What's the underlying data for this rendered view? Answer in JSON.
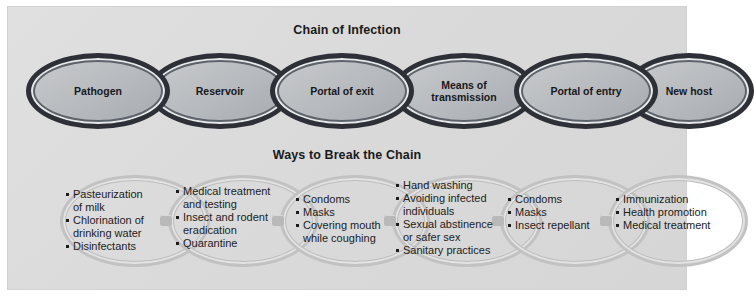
{
  "figure": {
    "background_color": "#dcdcdc",
    "panel_color": "#dadada"
  },
  "chain_section": {
    "title": "Chain of Infection",
    "link_fill_color": "#b6b9bd",
    "link_outline_color": "#2d3137",
    "links": [
      {
        "label": "Pathogen"
      },
      {
        "label": "Reservoir"
      },
      {
        "label": "Portal of exit"
      },
      {
        "label": "Means of\ntransmission"
      },
      {
        "label": "Portal of entry"
      },
      {
        "label": "New host"
      }
    ]
  },
  "break_section": {
    "title": "Ways to Break the Chain",
    "ring_color": "#c2c2c2",
    "groups": [
      {
        "items": [
          "Pasteurization\nof milk",
          "Chlorination of\ndrinking water",
          "Disinfectants"
        ]
      },
      {
        "items": [
          "Medical treatment\nand testing",
          "Insect and rodent\neradication",
          "Quarantine"
        ]
      },
      {
        "items": [
          "Condoms",
          "Masks",
          "Covering mouth\nwhile coughing"
        ]
      },
      {
        "items": [
          "Hand washing",
          "Avoiding infected\nindividuals",
          "Sexual abstinence\nor safer sex",
          "Sanitary practices"
        ]
      },
      {
        "items": [
          "Condoms",
          "Masks",
          "Insect repellant"
        ]
      },
      {
        "items": [
          "Immunization",
          "Health promotion",
          "Medical treatment"
        ]
      }
    ]
  }
}
